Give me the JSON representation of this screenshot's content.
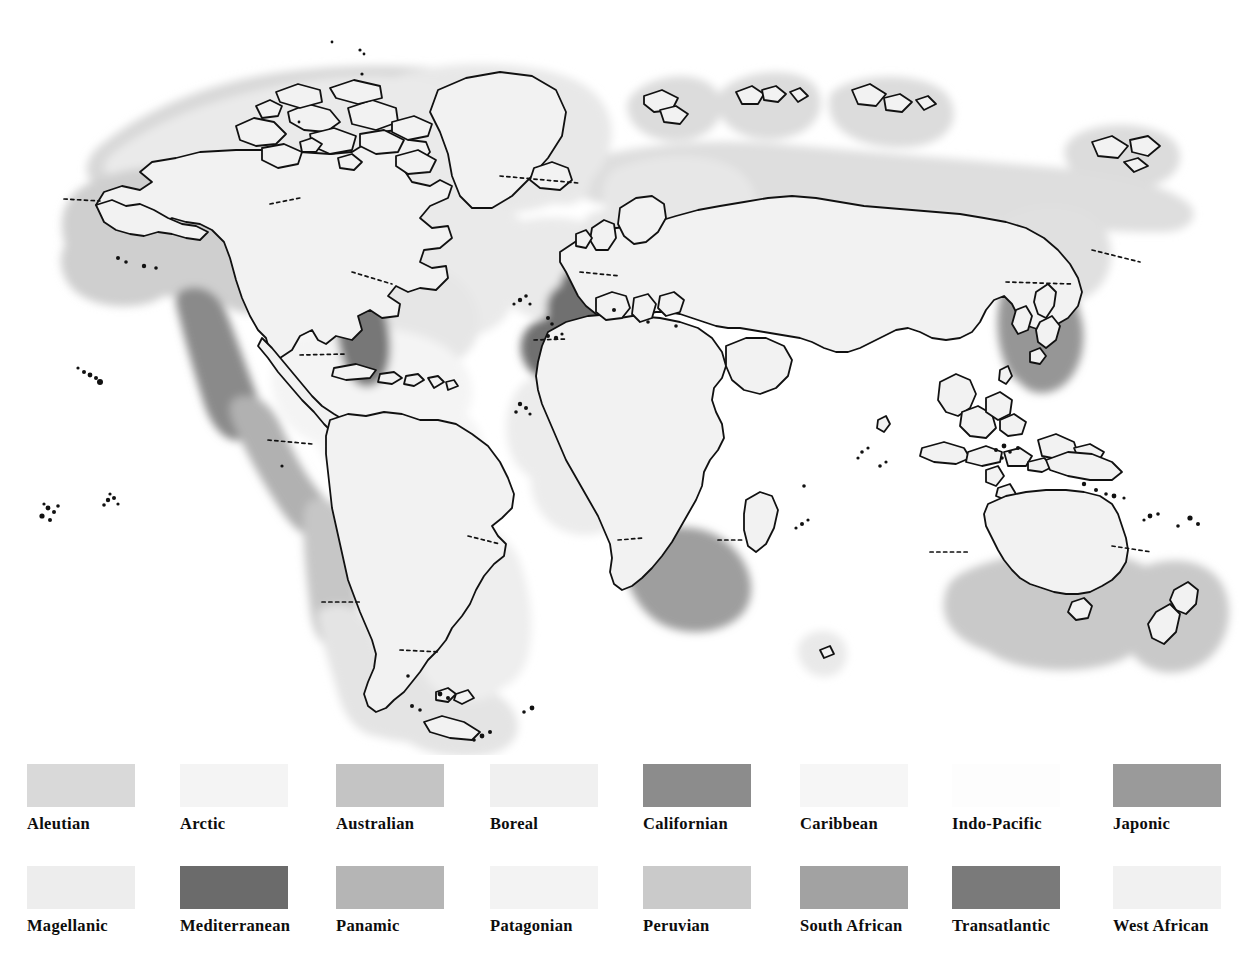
{
  "figure": {
    "type": "thematic-world-map",
    "projection": "world-outline",
    "background_color": "#ffffff",
    "coastline_color": "#111111",
    "boundary_line_style": "dotted"
  },
  "map": {
    "landmass_fill": "#f2f2f2",
    "ocean_fill": "#ffffff",
    "coastline_color": "#111111",
    "island_dot_color": "#111111",
    "regions": [
      {
        "name": "Aleutian",
        "color": "#d9d9d9",
        "where": "Alaska / Bering Sea / Aleutian arc"
      },
      {
        "name": "Arctic",
        "color": "#f4f4f4",
        "where": "Arctic Ocean margin, Siberian and Canadian Arctic coasts"
      },
      {
        "name": "Australian",
        "color": "#c4c4c4",
        "where": "Southern Australia, Tasmania, New Zealand"
      },
      {
        "name": "Boreal",
        "color": "#f0f0f0",
        "where": "North Atlantic, NW Europe, Greenland, Iceland, NE North America"
      },
      {
        "name": "Californian",
        "color": "#8c8c8c",
        "where": "Pacific coast of USA / Baja California"
      },
      {
        "name": "Caribbean",
        "color": "#f6f6f6",
        "where": "Gulf of Mexico, Caribbean Sea, tropical W Atlantic"
      },
      {
        "name": "Indo-Pacific",
        "color": "#fdfdfd",
        "where": "Tropical Indian Ocean and west Pacific"
      },
      {
        "name": "Japonic",
        "color": "#9a9a9a",
        "where": "Japan, Korea, Yellow Sea, NW Pacific"
      },
      {
        "name": "Magellanic",
        "color": "#ededed",
        "where": "Southern South America, Falklands, Tierra del Fuego"
      },
      {
        "name": "Mediterranean",
        "color": "#6b6b6b",
        "where": "Mediterranean Sea, Black Sea, NE Atlantic, Macaronesia"
      },
      {
        "name": "Panamic",
        "color": "#b5b5b5",
        "where": "Tropical eastern Pacific, Central America"
      },
      {
        "name": "Patagonian",
        "color": "#f3f3f3",
        "where": "Patagonian shelf, SW Atlantic"
      },
      {
        "name": "Peruvian",
        "color": "#cacaca",
        "where": "Pacific coast of Peru and northern Chile"
      },
      {
        "name": "South African",
        "color": "#a2a2a2",
        "where": "Southern tip of Africa, Cape region"
      },
      {
        "name": "Transatlantic",
        "color": "#7a7a7a",
        "where": "Atlantic coast of eastern USA"
      },
      {
        "name": "West African",
        "color": "#f1f1f1",
        "where": "Gulf of Guinea, tropical West African coast"
      }
    ]
  },
  "legend": {
    "columns": 8,
    "rows": 2,
    "swatch_width_px": 108,
    "swatch_height_px": 43,
    "items": [
      {
        "label": "Aleutian",
        "color": "#d9d9d9"
      },
      {
        "label": "Arctic",
        "color": "#f4f4f4"
      },
      {
        "label": "Australian",
        "color": "#c4c4c4"
      },
      {
        "label": "Boreal",
        "color": "#f0f0f0"
      },
      {
        "label": "Californian",
        "color": "#8c8c8c"
      },
      {
        "label": "Caribbean",
        "color": "#f6f6f6"
      },
      {
        "label": "Indo-Pacific",
        "color": "#fdfdfd"
      },
      {
        "label": "Japonic",
        "color": "#9a9a9a"
      },
      {
        "label": "Magellanic",
        "color": "#ededed"
      },
      {
        "label": "Mediterranean",
        "color": "#6b6b6b"
      },
      {
        "label": "Panamic",
        "color": "#b5b5b5"
      },
      {
        "label": "Patagonian",
        "color": "#f3f3f3"
      },
      {
        "label": "Peruvian",
        "color": "#cacaca"
      },
      {
        "label": "South African",
        "color": "#a2a2a2"
      },
      {
        "label": "Transatlantic",
        "color": "#7a7a7a"
      },
      {
        "label": "West African",
        "color": "#f1f1f1"
      }
    ]
  }
}
